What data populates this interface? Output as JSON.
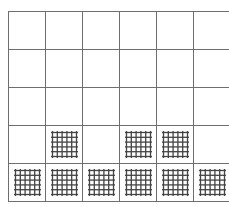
{
  "grid": {
    "columns": 6,
    "rows": 5,
    "cell_width": 37,
    "cell_height": 38,
    "line_color": "#6e6e6e",
    "mesh_color": "#444444",
    "mesh_lines": 6,
    "cells": [
      [
        0,
        0,
        0,
        0,
        0,
        0
      ],
      [
        0,
        0,
        0,
        0,
        0,
        0
      ],
      [
        0,
        0,
        0,
        0,
        0,
        0
      ],
      [
        0,
        1,
        0,
        1,
        1,
        0
      ],
      [
        1,
        1,
        1,
        1,
        1,
        1
      ]
    ]
  }
}
